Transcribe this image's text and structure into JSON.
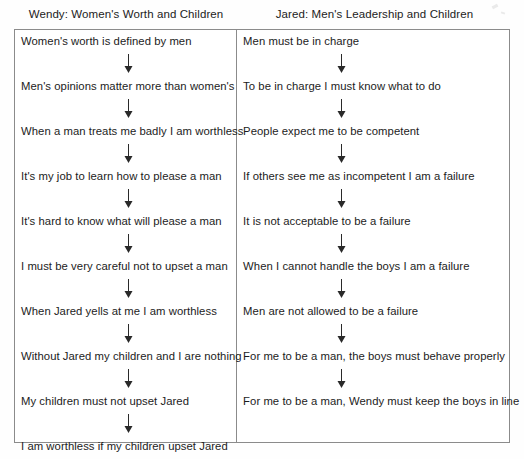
{
  "document": {
    "type": "two-column-flow-diagram",
    "orientation": "vertical-chains"
  },
  "columns": [
    {
      "id": "wendy",
      "header": "Wendy: Women's Worth and Children",
      "nodes": [
        "Women's worth is defined by men",
        "Men's opinions matter more than women's",
        "When a man treats me badly I am worthless",
        "It's my job to learn how to please a man",
        "It's hard to know what will please a man",
        "I must be very careful not to upset a man",
        "When Jared yells at me I am worthless",
        "Without Jared my children and I are nothing",
        "My children must not upset Jared",
        "I am worthless if my children upset Jared"
      ]
    },
    {
      "id": "jared",
      "header": "Jared: Men's Leadership and Children",
      "nodes": [
        "Men must be in charge",
        "To be in charge I must know what to do",
        "People expect me to be competent",
        "If others see me as incompetent I am a failure",
        "It is not acceptable to be a failure",
        "When I cannot handle the boys I am a failure",
        "Men are not allowed to be a failure",
        "For me to be a man, the boys must behave properly",
        "For me to be a man, Wendy must keep the boys in line"
      ]
    }
  ],
  "style": {
    "border_color": "#8b8b8b",
    "arrow_color": "#2a2a2a",
    "text_color": "#1c1c1c",
    "background": "#ffffff"
  },
  "icons": {
    "arrow": "down-arrow-icon"
  }
}
